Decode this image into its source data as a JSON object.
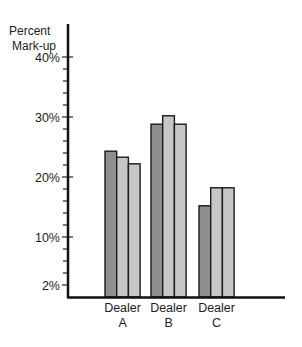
{
  "chart_data": {
    "type": "bar",
    "title": "",
    "xlabel": "",
    "ylabel": [
      "Percent",
      "Mark-up"
    ],
    "ylim": [
      0,
      44
    ],
    "yticks_labeled": [
      {
        "value": 40,
        "label": "40%"
      },
      {
        "value": 30,
        "label": "30%"
      },
      {
        "value": 20,
        "label": "20%"
      },
      {
        "value": 10,
        "label": "10%"
      },
      {
        "value": 2,
        "label": "2%"
      }
    ],
    "yticks_minor": [
      4,
      6,
      8,
      12,
      14,
      16,
      18,
      22,
      24,
      26,
      28,
      32,
      34,
      36,
      38
    ],
    "grid": false,
    "legend": null,
    "categories": [
      {
        "line1": "Dealer",
        "line2": "A"
      },
      {
        "line1": "Dealer",
        "line2": "B"
      },
      {
        "line1": "Dealer",
        "line2": "C"
      }
    ],
    "series": [
      {
        "name": "series-1",
        "color": "#8e8e8e",
        "values": [
          24.3,
          28.8,
          15.2
        ]
      },
      {
        "name": "series-2",
        "color": "#c6c6c6",
        "values": [
          23.3,
          30.2,
          18.2
        ]
      },
      {
        "name": "series-3",
        "color": "#c6c6c6",
        "values": [
          22.2,
          28.8,
          18.2
        ]
      }
    ]
  }
}
